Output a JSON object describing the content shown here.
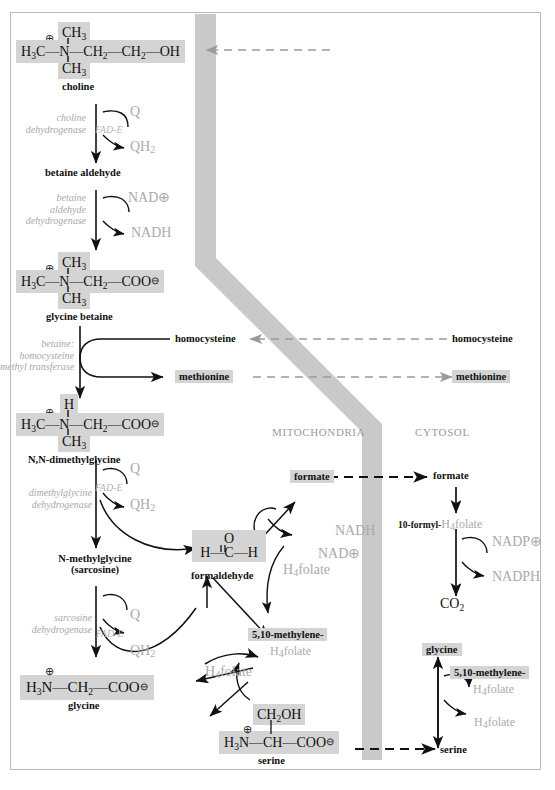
{
  "figure": {
    "compartments": {
      "left": "MITOCHONDRIA",
      "right": "CYTOSOL"
    },
    "colors": {
      "membrane": "#c9c9c9",
      "highlight": "#d4d4d4",
      "enzyme_text": "#a8a8a8",
      "cofactor_text": "#aaaaaa",
      "frame": "#b9b9b9",
      "ink": "#111111"
    }
  },
  "structures": {
    "choline": {
      "name": "choline",
      "top": "CH3",
      "bottom": "CH3",
      "charge": "⊕",
      "main": "H3C—N—CH2—CH2—OH"
    },
    "glycine_betaine": {
      "name": "glycine betaine",
      "top": "CH3",
      "bottom": "CH3",
      "charge": "⊕",
      "main": "H3C—N—CH2—COO⊖"
    },
    "dimethylglycine": {
      "name": "N,N-dimethylglycine",
      "top": "H",
      "bottom": "CH3",
      "charge": "⊕",
      "main": "H3C—N—CH2—COO⊖"
    },
    "formaldehyde": {
      "name": "formaldehyde",
      "top": "O",
      "main": "H—C—H"
    },
    "glycine": {
      "name": "glycine",
      "charge": "⊕",
      "main": "H3N—CH2—COO⊖"
    },
    "serine": {
      "name": "serine",
      "top": "CH2OH",
      "charge": "⊕",
      "main": "H3N—CH—COO⊖"
    }
  },
  "metabolites": {
    "betaine_aldehyde": "betaine aldehyde",
    "sarcosine_line1": "N-methylglycine",
    "sarcosine_line2": "(sarcosine)",
    "homocysteine_mito": "homocysteine",
    "methionine_mito": "methionine",
    "homocysteine_cyto": "homocysteine",
    "methionine_cyto": "methionine",
    "formate_mito": "formate",
    "formate_cyto": "formate",
    "formyl_folate_bold": "10-formyl-",
    "formyl_folate_gray": "H4folate",
    "co2": "CO2",
    "methylene_folate_mito_line1": "5,10-methylene-",
    "methylene_folate_mito_line2": "H4folate",
    "methylene_folate_cyto_line1": "5,10-methylene-",
    "methylene_folate_cyto_line2": "H4folate",
    "glycine_cyto": "glycine",
    "serine_cyto": "serine",
    "h4folate_a": "H4folate",
    "h4folate_b": "H4folate",
    "h4folate_c": "H4folate"
  },
  "enzymes": {
    "choline_dehydrogenase": [
      "choline",
      "dehydrogenase"
    ],
    "betaine_aldehyde_dehydrogenase": [
      "betaine",
      "aldehyde",
      "dehydrogenase"
    ],
    "betaine_homocysteine_methyl_transferase": [
      "betaine:",
      "homocysteine",
      "methyl transferase"
    ],
    "dimethylglycine_dehydrogenase": [
      "dimethylglycine",
      "dehydrogenase"
    ],
    "sarcosine_dehydrogenase": [
      "sarcosine",
      "dehydrogenase"
    ]
  },
  "cofactors": {
    "q1": "Q",
    "qh2_1": "QH2",
    "fade1": "FAD-E",
    "nad_plus_1": "NAD⊕",
    "nadh_1": "NADH",
    "q2": "Q",
    "qh2_2": "QH2",
    "fade2": "FAD-E",
    "q3": "Q",
    "qh2_3": "QH2",
    "fade3": "FAD-E",
    "nadh_2": "NADH",
    "nad_plus_2": "NAD⊕",
    "nadp_plus": "NADP⊕",
    "nadph": "NADPH"
  }
}
